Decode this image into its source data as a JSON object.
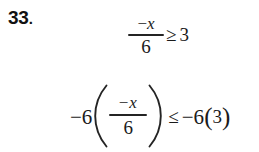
{
  "document": {
    "type": "math-worksheet-problem",
    "background_color": "#ffffff",
    "ink_color": "#1a1a1a"
  },
  "problem": {
    "number": "33",
    "number_punctuation": ".",
    "statement_plain": "-x/6 >= 3 ; -6(-x/6) <= -6(3)"
  },
  "equations": [
    {
      "id": "line-1",
      "plain": "-x/6 >= 3",
      "fraction": {
        "numerator_sign": "−",
        "numerator_variable": "x",
        "denominator": "6"
      },
      "relation": "≥",
      "right_side": "3"
    },
    {
      "id": "line-2",
      "plain": "-6(-x/6) <= -6(3)",
      "left_coefficient": "−6",
      "open_paren": "(",
      "fraction": {
        "numerator_sign": "−",
        "numerator_variable": "x",
        "denominator": "6"
      },
      "close_paren": ")",
      "relation": "≤",
      "right_coefficient": "−6",
      "right_open_paren": "(",
      "right_value": "3",
      "right_close_paren": ")"
    }
  ]
}
